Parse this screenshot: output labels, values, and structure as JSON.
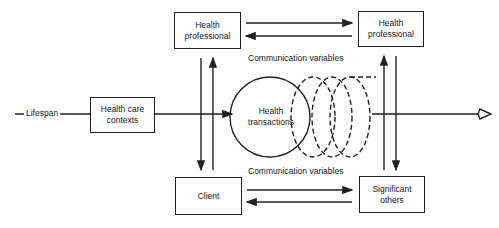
{
  "diagram": {
    "nodes": {
      "hp_left": {
        "label": "Health professional"
      },
      "hp_right": {
        "label": "Health professional"
      },
      "contexts": {
        "label": "Health care contexts"
      },
      "client": {
        "label": "Client"
      },
      "significant": {
        "label": "Significant others"
      },
      "transactions": {
        "label": "Health transactions"
      }
    },
    "labels": {
      "lifespan": "Lifespan",
      "comm_top": "Communication variables",
      "comm_bottom": "Communication variables"
    },
    "edges": [
      {
        "from": "hp_left",
        "to": "hp_right",
        "style": "arrow"
      },
      {
        "from": "hp_right",
        "to": "hp_left",
        "style": "arrow"
      },
      {
        "from": "client",
        "to": "significant",
        "style": "arrow"
      },
      {
        "from": "significant",
        "to": "client",
        "style": "arrow"
      },
      {
        "from": "hp_left",
        "to": "client",
        "style": "arrow"
      },
      {
        "from": "client",
        "to": "hp_left",
        "style": "arrow"
      },
      {
        "from": "significant",
        "to": "hp_right",
        "style": "arrow"
      },
      {
        "from": "hp_right",
        "to": "significant",
        "style": "arrow"
      },
      {
        "from": "contexts",
        "to": "transactions",
        "style": "arrow"
      },
      {
        "from": "transactions",
        "to": "open-end",
        "style": "arrow"
      }
    ],
    "colors": {
      "stroke": "#222222",
      "background": "#ffffff"
    }
  }
}
